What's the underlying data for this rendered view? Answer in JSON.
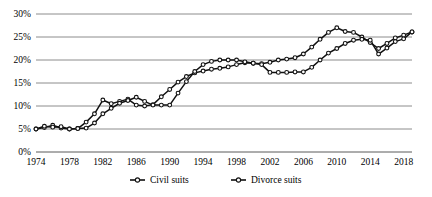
{
  "chart_data": {
    "type": "line",
    "title": "",
    "xlabel": "",
    "ylabel": "",
    "ylim": [
      0,
      30
    ],
    "xlim": [
      1974,
      2019
    ],
    "grid": true,
    "legend_position": "bottom",
    "ytick_labels": [
      "30%",
      "25%",
      "20%",
      "15%",
      "10%",
      "5%",
      "0%"
    ],
    "ytick_values": [
      30,
      25,
      20,
      15,
      10,
      5,
      0
    ],
    "xtick_labels": [
      "1974",
      "1978",
      "1982",
      "1986",
      "1990",
      "1994",
      "1998",
      "2002",
      "2006",
      "2010",
      "2014",
      "2018"
    ],
    "xtick_values": [
      1974,
      1978,
      1982,
      1986,
      1990,
      1994,
      1998,
      2002,
      2006,
      2010,
      2014,
      2018
    ],
    "x": [
      1974,
      1975,
      1976,
      1977,
      1978,
      1979,
      1980,
      1981,
      1982,
      1983,
      1984,
      1985,
      1986,
      1987,
      1988,
      1989,
      1990,
      1991,
      1992,
      1993,
      1994,
      1995,
      1996,
      1997,
      1998,
      1999,
      2000,
      2001,
      2002,
      2003,
      2004,
      2005,
      2006,
      2007,
      2008,
      2009,
      2010,
      2011,
      2012,
      2013,
      2014,
      2015,
      2016,
      2017,
      2018,
      2019
    ],
    "series": [
      {
        "name": "Civil suits",
        "marker": "filled-circle",
        "color": "#111111",
        "values": [
          5.0,
          5.3,
          5.8,
          5.2,
          5.0,
          5.1,
          6.5,
          8.3,
          11.3,
          10.5,
          11.0,
          11.5,
          10.2,
          10.0,
          10.3,
          12.0,
          13.6,
          15.2,
          16.4,
          17.2,
          17.6,
          18.0,
          18.2,
          18.5,
          19.0,
          19.4,
          19.3,
          19.2,
          19.5,
          20.0,
          20.2,
          20.5,
          21.3,
          22.8,
          24.5,
          26.0,
          27.0,
          26.2,
          26.0,
          25.0,
          23.8,
          22.5,
          23.6,
          24.8,
          25.4,
          26.1
        ]
      },
      {
        "name": "Divorce suits",
        "marker": "open-circle",
        "color": "#111111",
        "values": [
          5.0,
          5.6,
          5.4,
          5.5,
          5.0,
          5.1,
          5.2,
          6.3,
          8.3,
          9.5,
          10.6,
          11.2,
          11.9,
          11.0,
          10.2,
          10.2,
          10.2,
          12.8,
          15.3,
          17.5,
          19.0,
          19.7,
          20.0,
          20.0,
          20.0,
          19.6,
          19.3,
          19.0,
          17.3,
          17.3,
          17.3,
          17.4,
          17.4,
          18.4,
          20.0,
          21.5,
          22.5,
          23.6,
          24.3,
          24.5,
          24.3,
          21.3,
          22.6,
          24.0,
          24.6,
          26.1
        ]
      }
    ],
    "legend": [
      {
        "label": "Civil suits",
        "marker": "filled-circle"
      },
      {
        "label": "Divorce suits",
        "marker": "open-circle"
      }
    ]
  }
}
